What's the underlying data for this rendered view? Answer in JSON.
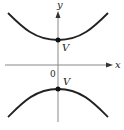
{
  "diagram": {
    "type": "hyperbola",
    "axes": {
      "x_label": "x",
      "y_label": "y",
      "origin_label": "0"
    },
    "vertices": [
      {
        "label": "V",
        "position": "upper"
      },
      {
        "label": "V",
        "position": "lower"
      }
    ],
    "colors": {
      "curve": "#222222",
      "axis": "#888888",
      "background": "#ffffff"
    }
  }
}
